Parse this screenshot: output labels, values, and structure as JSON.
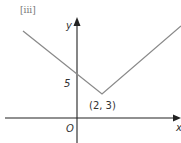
{
  "figure": {
    "part_label": "[iii]",
    "axes": {
      "x_label": "x",
      "y_label": "y",
      "origin_label": "O"
    },
    "annotations": {
      "y_intercept": "5",
      "vertex": "(2, 3)"
    },
    "graph": {
      "type": "absolute-value V shape",
      "vertex": [
        2,
        3
      ],
      "y_intercept": 5,
      "line_color": "#8a8a8a",
      "axis_color": "#222222"
    }
  }
}
